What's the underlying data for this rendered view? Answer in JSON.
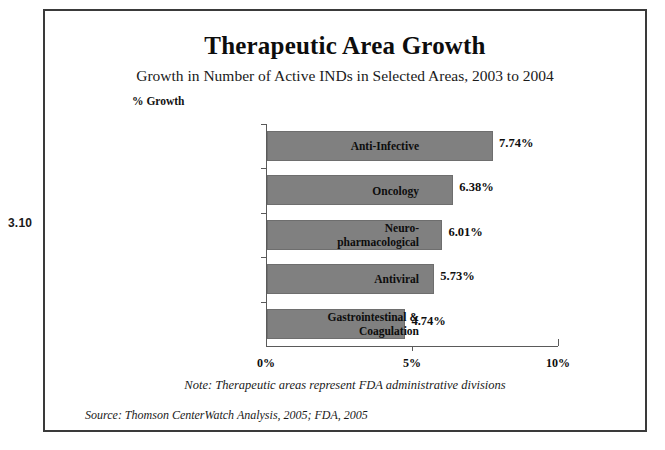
{
  "figure": {
    "number": "3.10"
  },
  "chart_data": {
    "type": "bar",
    "orientation": "horizontal",
    "title": "Therapeutic Area Growth",
    "subtitle": "Growth in Number of Active INDs in Selected Areas, 2003 to 2004",
    "xlabel": "",
    "ylabel": "",
    "unit_label": "% Growth",
    "categories": [
      "Anti-Infective",
      "Oncology",
      "Neuro-pharmacological",
      "Antiviral",
      "Gastrointestinal & Coagulation"
    ],
    "category_lines": [
      [
        "Anti-Infective"
      ],
      [
        "Oncology"
      ],
      [
        "Neuro-",
        "pharmacological"
      ],
      [
        "Antiviral"
      ],
      [
        "Gastrointestinal &",
        "Coagulation"
      ]
    ],
    "values": [
      7.74,
      6.38,
      6.01,
      5.73,
      4.74
    ],
    "value_labels": [
      "7.74%",
      "6.38%",
      "6.01%",
      "5.73%",
      "4.74%"
    ],
    "xlim": [
      0,
      10
    ],
    "xticks": [
      0,
      5,
      10
    ],
    "xtick_labels": [
      "0%",
      "5%",
      "10%"
    ],
    "grid": false,
    "legend": null,
    "bar_color": "#808080",
    "note": "Note: Therapeutic areas represent FDA administrative divisions",
    "source": "Source: Thomson CenterWatch Analysis, 2005; FDA, 2005"
  }
}
